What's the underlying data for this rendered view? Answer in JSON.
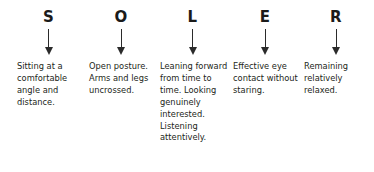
{
  "diagram": {
    "acronym": "SOLER",
    "arrow_icon": "arrow-down-icon",
    "columns": [
      {
        "letter": "S",
        "description": "Sitting at a comfortable angle and distance."
      },
      {
        "letter": "O",
        "description": "Open posture. Arms and legs uncrossed."
      },
      {
        "letter": "L",
        "description": "Leaning forward from time to time. Looking genuinely interested. Listening attentively."
      },
      {
        "letter": "E",
        "description": "Effective eye contact without staring."
      },
      {
        "letter": "R",
        "description": "Remaining relatively relaxed."
      }
    ],
    "colors": {
      "background": "#ffffff",
      "letter": "#1a1a1a",
      "text": "#231f20",
      "arrow": "#2b2b2b"
    }
  }
}
